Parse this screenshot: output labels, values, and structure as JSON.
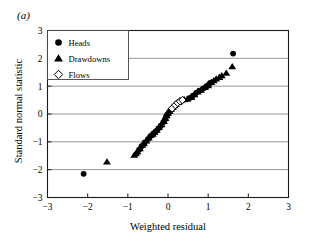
{
  "panel": {
    "label": "(a)"
  },
  "chart_data": {
    "type": "scatter",
    "title": "",
    "xlabel": "Weighted residual",
    "ylabel": "Standard normal statistic",
    "xlim": [
      -3,
      3
    ],
    "ylim": [
      -3,
      3
    ],
    "xticks": [
      -3,
      -2,
      -1,
      0,
      1,
      2,
      3
    ],
    "yticks": [
      -3,
      -2,
      -1,
      0,
      1,
      2,
      3
    ],
    "xticklabels": [
      "−3",
      "−2",
      "−1",
      "0",
      "1",
      "2",
      "3"
    ],
    "yticklabels": [
      "−3",
      "−2",
      "−1",
      "0",
      "1",
      "2",
      "3"
    ],
    "grid": "horizontal",
    "legend_position": "upper-left",
    "legend": [
      {
        "name": "Heads",
        "marker": "filled-circle"
      },
      {
        "name": "Drawdowns",
        "marker": "filled-triangle"
      },
      {
        "name": "Flows",
        "marker": "open-diamond"
      }
    ],
    "series": [
      {
        "name": "Heads",
        "marker": "filled-circle",
        "points": [
          [
            -2.1,
            -2.15
          ],
          [
            -0.72,
            -1.28
          ],
          [
            -0.66,
            -1.16
          ],
          [
            -0.58,
            -1.02
          ],
          [
            -0.5,
            -0.9
          ],
          [
            -0.44,
            -0.8
          ],
          [
            -0.36,
            -0.7
          ],
          [
            -0.3,
            -0.62
          ],
          [
            -0.24,
            -0.52
          ],
          [
            -0.18,
            -0.42
          ],
          [
            -0.12,
            -0.3
          ],
          [
            -0.08,
            -0.2
          ],
          [
            -0.05,
            -0.1
          ],
          [
            -0.02,
            -0.02
          ],
          [
            0.02,
            0.06
          ],
          [
            0.06,
            0.14
          ],
          [
            0.55,
            0.58
          ],
          [
            0.62,
            0.66
          ],
          [
            0.7,
            0.76
          ],
          [
            0.78,
            0.84
          ],
          [
            0.88,
            0.92
          ],
          [
            0.96,
            1.0
          ],
          [
            1.02,
            1.06
          ],
          [
            1.05,
            1.12
          ],
          [
            1.62,
            2.17
          ]
        ]
      },
      {
        "name": "Drawdowns",
        "marker": "filled-triangle",
        "points": [
          [
            -1.52,
            -1.72
          ],
          [
            -0.84,
            -1.48
          ],
          [
            -0.8,
            -1.42
          ],
          [
            -0.76,
            -1.36
          ],
          [
            -0.7,
            -1.24
          ],
          [
            -0.64,
            -1.12
          ],
          [
            -0.6,
            -1.06
          ],
          [
            -0.54,
            -0.96
          ],
          [
            -0.48,
            -0.86
          ],
          [
            -0.42,
            -0.76
          ],
          [
            -0.38,
            -0.72
          ],
          [
            -0.34,
            -0.66
          ],
          [
            -0.28,
            -0.58
          ],
          [
            -0.22,
            -0.48
          ],
          [
            -0.16,
            -0.38
          ],
          [
            -0.1,
            -0.26
          ],
          [
            -0.06,
            -0.16
          ],
          [
            -0.03,
            -0.06
          ],
          [
            0.0,
            0.02
          ],
          [
            0.04,
            0.1
          ],
          [
            0.08,
            0.18
          ],
          [
            0.12,
            0.24
          ],
          [
            0.16,
            0.3
          ],
          [
            0.2,
            0.36
          ],
          [
            0.26,
            0.42
          ],
          [
            0.32,
            0.48
          ],
          [
            0.4,
            0.52
          ],
          [
            0.48,
            0.54
          ],
          [
            0.58,
            0.6
          ],
          [
            0.66,
            0.7
          ],
          [
            0.74,
            0.8
          ],
          [
            0.82,
            0.86
          ],
          [
            0.92,
            0.96
          ],
          [
            1.0,
            1.02
          ],
          [
            1.08,
            1.14
          ],
          [
            1.14,
            1.2
          ],
          [
            1.2,
            1.26
          ],
          [
            1.28,
            1.32
          ],
          [
            1.34,
            1.38
          ],
          [
            1.45,
            1.47
          ],
          [
            1.6,
            1.7
          ]
        ]
      },
      {
        "name": "Flows",
        "marker": "open-diamond",
        "points": [
          [
            0.1,
            0.2
          ],
          [
            0.18,
            0.32
          ],
          [
            0.24,
            0.4
          ],
          [
            0.3,
            0.46
          ],
          [
            0.36,
            0.5
          ]
        ]
      }
    ]
  }
}
